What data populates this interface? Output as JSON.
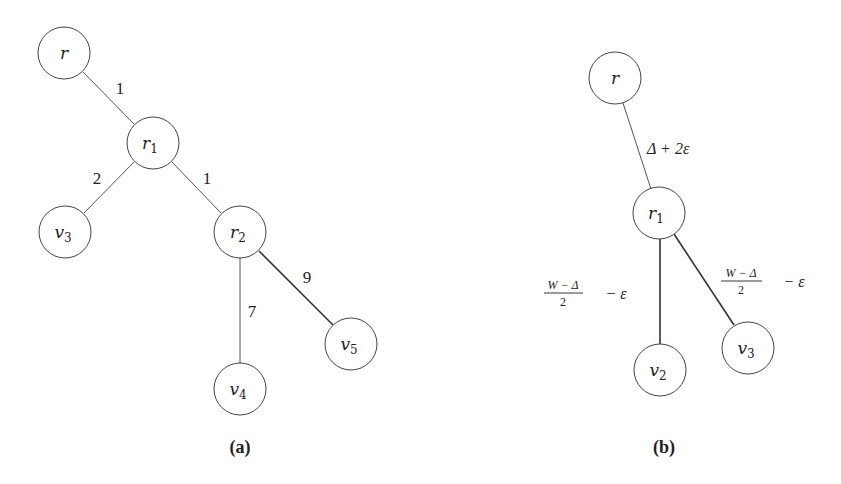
{
  "diagrams": [
    {
      "id": "a",
      "caption": "(a)",
      "nodes": [
        {
          "key": "r",
          "base": "r",
          "sub": ""
        },
        {
          "key": "r1",
          "base": "r",
          "sub": "1"
        },
        {
          "key": "v3",
          "base": "v",
          "sub": "3"
        },
        {
          "key": "r2",
          "base": "r",
          "sub": "2"
        },
        {
          "key": "v4",
          "base": "v",
          "sub": "4"
        },
        {
          "key": "v5",
          "base": "v",
          "sub": "5"
        }
      ],
      "edges": [
        {
          "from": "r",
          "to": "r1",
          "weight": "1"
        },
        {
          "from": "r1",
          "to": "v3",
          "weight": "2"
        },
        {
          "from": "r1",
          "to": "r2",
          "weight": "1"
        },
        {
          "from": "r2",
          "to": "v4",
          "weight": "7"
        },
        {
          "from": "r2",
          "to": "v5",
          "weight": "9"
        }
      ]
    },
    {
      "id": "b",
      "caption": "(b)",
      "nodes": [
        {
          "key": "r",
          "base": "r",
          "sub": ""
        },
        {
          "key": "r1",
          "base": "r",
          "sub": "1"
        },
        {
          "key": "v2",
          "base": "v",
          "sub": "2"
        },
        {
          "key": "v3",
          "base": "v",
          "sub": "3"
        }
      ],
      "edges": [
        {
          "from": "r",
          "to": "r1",
          "weight": "Δ + 2ε"
        },
        {
          "from": "r1",
          "to": "v2",
          "weight_numerator": "W − Δ",
          "weight_denominator": "2",
          "weight_suffix": "− ε"
        },
        {
          "from": "r1",
          "to": "v3",
          "weight_numerator": "W − Δ",
          "weight_denominator": "2",
          "weight_suffix": "− ε"
        }
      ]
    }
  ]
}
